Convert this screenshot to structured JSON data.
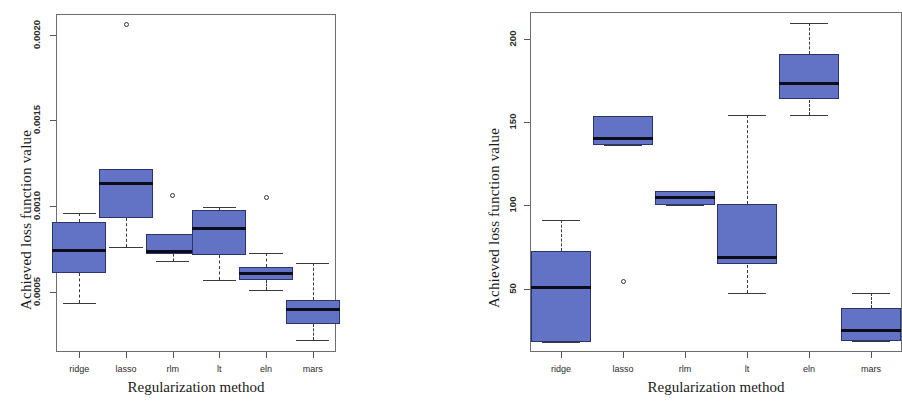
{
  "chart_data": [
    {
      "type": "box",
      "panel": "left",
      "title": "",
      "xlabel": "Regularization method",
      "ylabel": "Achieved loss function value",
      "categories": [
        "ridge",
        "lasso",
        "rlm",
        "lt",
        "eln",
        "mars"
      ],
      "ytick_labels": [
        "0.0005",
        "0.0010",
        "0.0015",
        "0.0020"
      ],
      "ytick_values": [
        0.0005,
        0.001,
        0.0015,
        0.002
      ],
      "ylim": [
        0.00015,
        0.00212
      ],
      "grid": false,
      "legend": "none",
      "boxes": [
        {
          "category": "ridge",
          "whisker_low": 0.000435,
          "q1": 0.00061,
          "median": 0.000742,
          "q3": 0.00091,
          "whisker_high": 0.000962,
          "outliers": []
        },
        {
          "category": "lasso",
          "whisker_low": 0.000762,
          "q1": 0.00093,
          "median": 0.00113,
          "q3": 0.001215,
          "whisker_high": 0.001215,
          "outliers": [
            0.00206
          ]
        },
        {
          "category": "rlm",
          "whisker_low": 0.00068,
          "q1": 0.000722,
          "median": 0.000737,
          "q3": 0.00084,
          "whisker_high": 0.00084,
          "outliers": [
            0.001065
          ]
        },
        {
          "category": "lt",
          "whisker_low": 0.00057,
          "q1": 0.000715,
          "median": 0.000872,
          "q3": 0.000975,
          "whisker_high": 0.000998,
          "outliers": []
        },
        {
          "category": "eln",
          "whisker_low": 0.000512,
          "q1": 0.00057,
          "median": 0.000608,
          "q3": 0.000645,
          "whisker_high": 0.000728,
          "outliers": [
            0.001048
          ]
        },
        {
          "category": "mars",
          "whisker_low": 0.000222,
          "q1": 0.000312,
          "median": 0.0004,
          "q3": 0.000452,
          "whisker_high": 0.000668,
          "outliers": []
        }
      ]
    },
    {
      "type": "box",
      "panel": "right",
      "title": "",
      "xlabel": "Regularization method",
      "ylabel": "Achieved loss function value",
      "categories": [
        "ridge",
        "lasso",
        "rlm",
        "lt",
        "eln",
        "mars"
      ],
      "ytick_labels": [
        "50",
        "100",
        "150",
        "200"
      ],
      "ytick_values": [
        50,
        100,
        150,
        200
      ],
      "ylim": [
        12,
        216
      ],
      "grid": false,
      "legend": "none",
      "boxes": [
        {
          "category": "ridge",
          "whisker_low": 18.0,
          "q1": 18.0,
          "median": 50.5,
          "q3": 72.5,
          "whisker_high": 91.5,
          "outliers": []
        },
        {
          "category": "lasso",
          "whisker_low": 136.0,
          "q1": 136.0,
          "median": 140.0,
          "q3": 153.5,
          "whisker_high": 153.5,
          "outliers": [
            54.5
          ]
        },
        {
          "category": "rlm",
          "whisker_low": 100.0,
          "q1": 100.0,
          "median": 104.5,
          "q3": 108.5,
          "whisker_high": 108.5,
          "outliers": []
        },
        {
          "category": "lt",
          "whisker_low": 47.5,
          "q1": 64.5,
          "median": 69.0,
          "q3": 101.0,
          "whisker_high": 154.0,
          "outliers": []
        },
        {
          "category": "eln",
          "whisker_low": 154.5,
          "q1": 163.5,
          "median": 173.0,
          "q3": 191.0,
          "whisker_high": 209.5,
          "outliers": []
        },
        {
          "category": "mars",
          "whisker_low": 18.5,
          "q1": 18.5,
          "median": 25.0,
          "q3": 38.5,
          "whisker_high": 47.5,
          "outliers": []
        }
      ]
    }
  ],
  "left": {
    "ylabel": "Achieved loss function value",
    "xlabel": "Regularization method",
    "yticks": [
      "0.0005",
      "0.0010",
      "0.0015",
      "0.0020"
    ],
    "xticks": [
      "ridge",
      "lasso",
      "rlm",
      "lt",
      "eln",
      "mars"
    ]
  },
  "right": {
    "ylabel": "Achieved loss function value",
    "xlabel": "Regularization method",
    "yticks": [
      "50",
      "100",
      "150",
      "200"
    ],
    "xticks": [
      "ridge",
      "lasso",
      "rlm",
      "lt",
      "eln",
      "mars"
    ]
  }
}
